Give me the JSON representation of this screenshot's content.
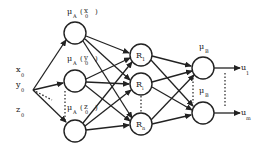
{
  "diagram": {
    "type": "fuzzy neural network",
    "inputs": [
      {
        "name": "x",
        "sub": "0"
      },
      {
        "name": "y",
        "sub": "0"
      },
      {
        "name": "z",
        "sub": "0"
      }
    ],
    "membership_nodes": [
      {
        "label": "μ",
        "sub": "A",
        "arg": "x",
        "argsub": "0",
        "idx": "1"
      },
      {
        "label": "μ",
        "sub": "A",
        "arg": "y",
        "argsub": "0",
        "idx": "i"
      },
      {
        "label": "μ",
        "sub": "A",
        "arg": "z",
        "argsub": "0",
        "idx": "r"
      }
    ],
    "rule_nodes": [
      {
        "label": "R",
        "sub": "1"
      },
      {
        "label": "R",
        "sub": "i"
      },
      {
        "label": "R",
        "sub": "n"
      }
    ],
    "output_membership_nodes": [
      {
        "label": "μ",
        "sub": "B",
        "idx": "1"
      },
      {
        "label": "μ",
        "sub": "B",
        "idx": "e"
      }
    ],
    "outputs": [
      {
        "name": "u",
        "sub": "1"
      },
      {
        "name": "u",
        "sub": "m"
      }
    ]
  }
}
